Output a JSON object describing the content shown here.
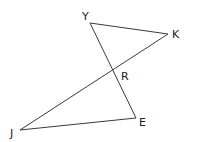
{
  "diagram": {
    "title": "",
    "points": [
      {
        "id": "Y",
        "label": "Y",
        "x": 90,
        "y": 23,
        "lx": 82,
        "ly": 20
      },
      {
        "id": "K",
        "label": "K",
        "x": 168,
        "y": 34,
        "lx": 172,
        "ly": 38
      },
      {
        "id": "R",
        "label": "R",
        "x": 114,
        "y": 73,
        "lx": 121,
        "ly": 80
      },
      {
        "id": "J",
        "label": "J",
        "x": 20,
        "y": 130,
        "lx": 10,
        "ly": 137
      },
      {
        "id": "E",
        "label": "E",
        "x": 136,
        "y": 118,
        "lx": 139,
        "ly": 126
      }
    ],
    "segments": [
      {
        "from": "Y",
        "to": "K"
      },
      {
        "from": "Y",
        "to": "E"
      },
      {
        "from": "K",
        "to": "J"
      },
      {
        "from": "J",
        "to": "E"
      }
    ],
    "colors": {
      "line": "#3a3a3a",
      "text": "#222222",
      "background": "#ffffff"
    }
  }
}
